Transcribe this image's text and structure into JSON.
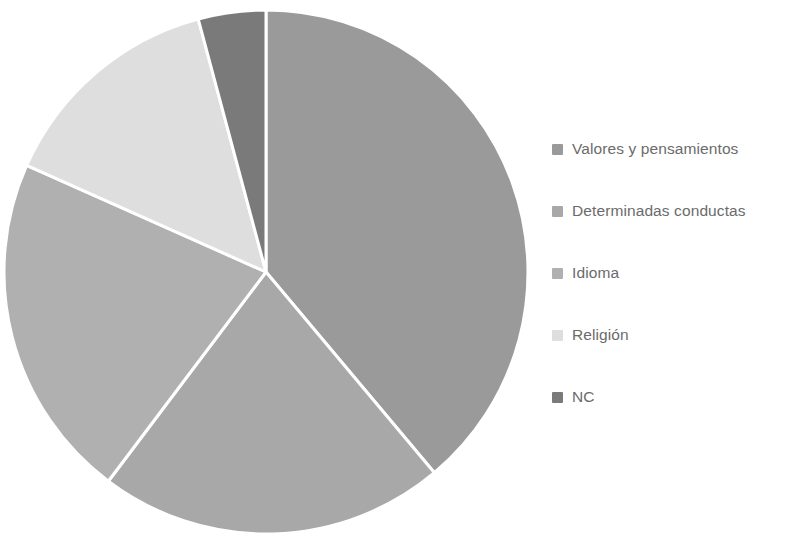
{
  "chart_data": {
    "type": "pie",
    "title": "",
    "subtitle": "",
    "xlabel": "",
    "ylabel": "",
    "grid": false,
    "legend_position": "right",
    "start_angle_deg": 0,
    "direction": "clockwise",
    "center": {
      "x": 266,
      "y": 272
    },
    "radius": 262,
    "categories": [
      "Valores y pensamientos",
      "Determinadas conductas",
      "Idioma",
      "Religión",
      "NC"
    ],
    "values": [
      38.9,
      21.4,
      21.4,
      14.2,
      4.1
    ],
    "angles_deg": [
      140,
      77,
      77,
      51,
      15
    ],
    "colors": [
      "#9a9a9a",
      "#a8a8a8",
      "#b0b0b0",
      "#dedede",
      "#7a7a7a"
    ],
    "slice_separator_color": "#ffffff",
    "slice_separator_width": 3,
    "slices": [
      {
        "label": "Valores y pensamientos",
        "value": 38.9,
        "start_deg": 0,
        "end_deg": 140,
        "color": "#9a9a9a"
      },
      {
        "label": "Determinadas conductas",
        "value": 21.4,
        "start_deg": 140,
        "end_deg": 217,
        "color": "#a8a8a8"
      },
      {
        "label": "Idioma",
        "value": 21.4,
        "start_deg": 217,
        "end_deg": 294,
        "color": "#b0b0b0"
      },
      {
        "label": "Religión",
        "value": 14.2,
        "start_deg": 294,
        "end_deg": 345,
        "color": "#dedede"
      },
      {
        "label": "NC",
        "value": 4.1,
        "start_deg": 345,
        "end_deg": 360,
        "color": "#7a7a7a"
      }
    ]
  },
  "legend": {
    "items": [
      {
        "label": "Valores y pensamientos",
        "color": "#9a9a9a"
      },
      {
        "label": "Determinadas conductas",
        "color": "#a8a8a8"
      },
      {
        "label": "Idioma",
        "color": "#b0b0b0"
      },
      {
        "label": "Religión",
        "color": "#dedede"
      },
      {
        "label": "NC",
        "color": "#7a7a7a"
      }
    ]
  },
  "style": {
    "background": "#ffffff",
    "legend_text_color": "#6b6b6b"
  }
}
